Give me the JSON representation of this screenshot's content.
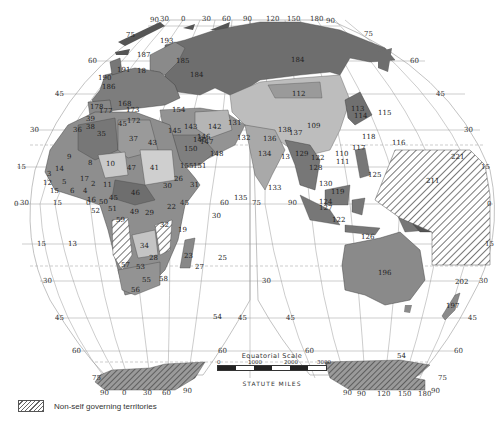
{
  "map": {
    "projection": "interrupted (Goode-style) world map, two lobes",
    "colors": {
      "land_dark": "#6e6e6e",
      "land_mid": "#8f8f8f",
      "land_light": "#b9b9b9",
      "land_lighter": "#d2d2d2",
      "hatch": "#555555",
      "grid": "#9a9a9a",
      "background": "#ffffff"
    },
    "legend": {
      "swatch": "diagonal-hatch",
      "label": "Non-self governing territories"
    },
    "scale": {
      "title": "Equatorial Scale",
      "ticks": [
        "0",
        "1000",
        "2000",
        "3000"
      ],
      "units": "STATUTE MILES"
    },
    "graticule": {
      "top_lon_left": [
        "90",
        "30",
        "0",
        "30",
        "60",
        "90"
      ],
      "top_lon_right": [
        "120",
        "150",
        "180",
        "90"
      ],
      "bottom_lon_left": [
        "90",
        "0",
        "30",
        "60",
        "90"
      ],
      "bottom_lon_right": [
        "90",
        "90",
        "120",
        "150",
        "180",
        "90"
      ],
      "lat_left_north": [
        "75",
        "60",
        "45",
        "30",
        "15"
      ],
      "lat_right_north": [
        "75",
        "60",
        "45",
        "30",
        "15"
      ],
      "equator_left": "0",
      "equator_lons": [
        "30",
        "15",
        "0",
        "45",
        "60",
        "75",
        "90"
      ],
      "lat_left_south": [
        "15",
        "30",
        "45",
        "60",
        "75"
      ],
      "lat_mid_south": [
        "15",
        "30",
        "45",
        "60"
      ],
      "lat_right_south": [
        "15",
        "30",
        "45",
        "60",
        "75"
      ],
      "equator_right": "0"
    },
    "country_labels": [
      {
        "t": "75",
        "x": 126,
        "y": 32
      },
      {
        "t": "193",
        "x": 160,
        "y": 38
      },
      {
        "t": "187",
        "x": 137,
        "y": 52
      },
      {
        "t": "185",
        "x": 176,
        "y": 58
      },
      {
        "t": "184",
        "x": 190,
        "y": 72
      },
      {
        "t": "184",
        "x": 291,
        "y": 57
      },
      {
        "t": "191",
        "x": 117,
        "y": 67
      },
      {
        "t": "190",
        "x": 98,
        "y": 75
      },
      {
        "t": "186",
        "x": 102,
        "y": 84
      },
      {
        "t": "18",
        "x": 137,
        "y": 68
      },
      {
        "t": "178",
        "x": 90,
        "y": 104
      },
      {
        "t": "177",
        "x": 99,
        "y": 108
      },
      {
        "t": "168",
        "x": 118,
        "y": 101
      },
      {
        "t": "173",
        "x": 126,
        "y": 107
      },
      {
        "t": "39",
        "x": 86,
        "y": 116
      },
      {
        "t": "36",
        "x": 73,
        "y": 127
      },
      {
        "t": "38",
        "x": 86,
        "y": 124
      },
      {
        "t": "172",
        "x": 127,
        "y": 118
      },
      {
        "t": "45",
        "x": 118,
        "y": 121
      },
      {
        "t": "154",
        "x": 172,
        "y": 107
      },
      {
        "t": "143",
        "x": 184,
        "y": 124
      },
      {
        "t": "142",
        "x": 208,
        "y": 124
      },
      {
        "t": "131",
        "x": 228,
        "y": 120
      },
      {
        "t": "145",
        "x": 168,
        "y": 128
      },
      {
        "t": "146",
        "x": 197,
        "y": 134
      },
      {
        "t": "140",
        "x": 193,
        "y": 137
      },
      {
        "t": "147",
        "x": 200,
        "y": 139
      },
      {
        "t": "150",
        "x": 184,
        "y": 146
      },
      {
        "t": "148",
        "x": 210,
        "y": 151
      },
      {
        "t": "132",
        "x": 237,
        "y": 135
      },
      {
        "t": "35",
        "x": 97,
        "y": 131
      },
      {
        "t": "37",
        "x": 129,
        "y": 136
      },
      {
        "t": "43",
        "x": 148,
        "y": 140
      },
      {
        "t": "9",
        "x": 67,
        "y": 154
      },
      {
        "t": "8",
        "x": 88,
        "y": 160
      },
      {
        "t": "10",
        "x": 106,
        "y": 161
      },
      {
        "t": "47",
        "x": 127,
        "y": 165
      },
      {
        "t": "41",
        "x": 150,
        "y": 165
      },
      {
        "t": "155",
        "x": 180,
        "y": 163
      },
      {
        "t": "151",
        "x": 193,
        "y": 163
      },
      {
        "t": "14",
        "x": 55,
        "y": 166
      },
      {
        "t": "3",
        "x": 47,
        "y": 171
      },
      {
        "t": "12",
        "x": 43,
        "y": 180
      },
      {
        "t": "5",
        "x": 62,
        "y": 179
      },
      {
        "t": "17",
        "x": 80,
        "y": 176
      },
      {
        "t": "2",
        "x": 91,
        "y": 181
      },
      {
        "t": "11",
        "x": 103,
        "y": 182
      },
      {
        "t": "6",
        "x": 70,
        "y": 188
      },
      {
        "t": "15",
        "x": 50,
        "y": 188
      },
      {
        "t": "4",
        "x": 83,
        "y": 188
      },
      {
        "t": "16",
        "x": 87,
        "y": 197
      },
      {
        "t": "50",
        "x": 99,
        "y": 199
      },
      {
        "t": "45",
        "x": 109,
        "y": 195
      },
      {
        "t": "46",
        "x": 131,
        "y": 190
      },
      {
        "t": "26",
        "x": 174,
        "y": 176
      },
      {
        "t": "30",
        "x": 163,
        "y": 183
      },
      {
        "t": "31",
        "x": 190,
        "y": 182
      },
      {
        "t": "52",
        "x": 91,
        "y": 208
      },
      {
        "t": "51",
        "x": 108,
        "y": 206
      },
      {
        "t": "49",
        "x": 130,
        "y": 209
      },
      {
        "t": "29",
        "x": 145,
        "y": 210
      },
      {
        "t": "22",
        "x": 167,
        "y": 204
      },
      {
        "t": "59",
        "x": 116,
        "y": 217
      },
      {
        "t": "32",
        "x": 160,
        "y": 222
      },
      {
        "t": "19",
        "x": 178,
        "y": 227
      },
      {
        "t": "34",
        "x": 140,
        "y": 243
      },
      {
        "t": "13",
        "x": 68,
        "y": 241
      },
      {
        "t": "28",
        "x": 149,
        "y": 255
      },
      {
        "t": "23",
        "x": 184,
        "y": 253
      },
      {
        "t": "25",
        "x": 218,
        "y": 255
      },
      {
        "t": "27",
        "x": 195,
        "y": 264
      },
      {
        "t": "57",
        "x": 121,
        "y": 262
      },
      {
        "t": "53",
        "x": 136,
        "y": 264
      },
      {
        "t": "55",
        "x": 142,
        "y": 277
      },
      {
        "t": "58",
        "x": 159,
        "y": 276
      },
      {
        "t": "56",
        "x": 131,
        "y": 287
      },
      {
        "t": "54",
        "x": 213,
        "y": 314
      },
      {
        "t": "30",
        "x": 212,
        "y": 213
      },
      {
        "t": "135",
        "x": 234,
        "y": 195
      },
      {
        "t": "112",
        "x": 292,
        "y": 91
      },
      {
        "t": "113",
        "x": 351,
        "y": 106
      },
      {
        "t": "114",
        "x": 354,
        "y": 113
      },
      {
        "t": "115",
        "x": 378,
        "y": 110
      },
      {
        "t": "109",
        "x": 307,
        "y": 123
      },
      {
        "t": "138",
        "x": 278,
        "y": 127
      },
      {
        "t": "137",
        "x": 289,
        "y": 130
      },
      {
        "t": "136",
        "x": 263,
        "y": 136
      },
      {
        "t": "118",
        "x": 362,
        "y": 134
      },
      {
        "t": "117",
        "x": 352,
        "y": 145
      },
      {
        "t": "116",
        "x": 392,
        "y": 140
      },
      {
        "t": "134",
        "x": 258,
        "y": 151
      },
      {
        "t": "13",
        "x": 281,
        "y": 154
      },
      {
        "t": "129",
        "x": 295,
        "y": 151
      },
      {
        "t": "122",
        "x": 311,
        "y": 155
      },
      {
        "t": "110",
        "x": 335,
        "y": 151
      },
      {
        "t": "111",
        "x": 336,
        "y": 159
      },
      {
        "t": "221",
        "x": 451,
        "y": 154
      },
      {
        "t": "128",
        "x": 309,
        "y": 165
      },
      {
        "t": "125",
        "x": 368,
        "y": 172
      },
      {
        "t": "211",
        "x": 426,
        "y": 178
      },
      {
        "t": "133",
        "x": 268,
        "y": 185
      },
      {
        "t": "130",
        "x": 319,
        "y": 181
      },
      {
        "t": "119",
        "x": 331,
        "y": 189
      },
      {
        "t": "124",
        "x": 319,
        "y": 199
      },
      {
        "t": "127",
        "x": 319,
        "y": 205
      },
      {
        "t": "122",
        "x": 332,
        "y": 217
      },
      {
        "t": "126",
        "x": 361,
        "y": 234
      },
      {
        "t": "196",
        "x": 378,
        "y": 270
      },
      {
        "t": "202",
        "x": 455,
        "y": 279
      },
      {
        "t": "197",
        "x": 446,
        "y": 303
      },
      {
        "t": "54",
        "x": 397,
        "y": 353
      }
    ]
  }
}
